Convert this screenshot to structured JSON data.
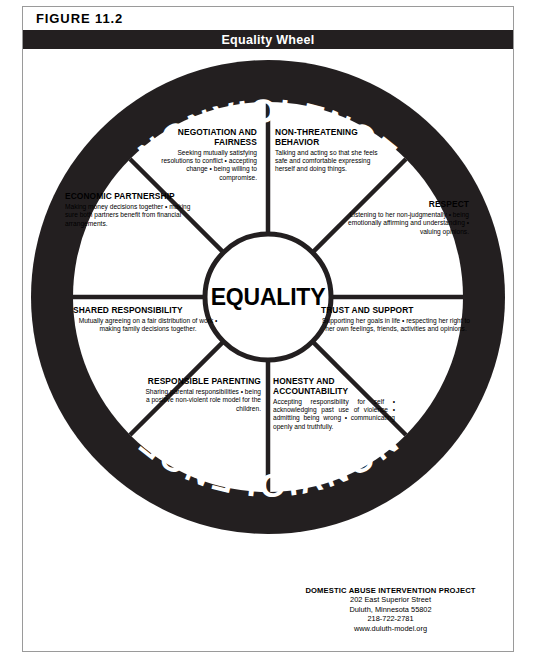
{
  "figure": {
    "label": "FIGURE 11.2",
    "title": "Equality Wheel"
  },
  "wheel": {
    "rim_top_label": "NONVIOLENCE",
    "rim_bottom_label": "NONVIOLENCE",
    "hub_label": "EQUALITY",
    "segments": [
      {
        "id": "negotiation",
        "heading": "NEGOTIATION AND FAIRNESS",
        "body": "Seeking mutually satisfying resolutions to conflict • accepting change • being willing to compromise."
      },
      {
        "id": "non-threatening-behavior",
        "heading": "NON-THREATENING BEHAVIOR",
        "body": "Talking and acting so that she feels safe and comfortable expressing herself and doing things."
      },
      {
        "id": "economic-partnership",
        "heading": "ECONOMIC PARTNERSHIP",
        "body": "Making money decisions together • making sure both partners benefit from financial arrangements."
      },
      {
        "id": "respect",
        "heading": "RESPECT",
        "body": "Listening to her non-judgmentally • being emotionally affirming and understanding • valuing opinions."
      },
      {
        "id": "shared-responsibility",
        "heading": "SHARED RESPONSIBILITY",
        "body": "Mutually agreeing on a fair distribution of work • making family decisions together."
      },
      {
        "id": "trust-and-support",
        "heading": "TRUST AND SUPPORT",
        "body": "Supporting her goals in life • respecting her right to her own feelings, friends, activities and opinions."
      },
      {
        "id": "responsible-parenting",
        "heading": "RESPONSIBLE PARENTING",
        "body": "Sharing parental responsibilities • being a positive non-violent role model for the children."
      },
      {
        "id": "honesty-and-accountability",
        "heading": "HONESTY AND ACCOUNTABILITY",
        "body": "Accepting responsibility for self • acknowledging past use of violence • admitting being wrong • communicating openly and truthfully."
      }
    ]
  },
  "footer": {
    "organization": "DOMESTIC ABUSE INTERVENTION PROJECT",
    "address_line1": "202 East Superior Street",
    "address_line2": "Duluth, Minnesota 55802",
    "phone": "218-722-2781",
    "website": "www.duluth-model.org"
  },
  "colors": {
    "ink": "#231f20",
    "frame": "#9a9a9a",
    "page": "#ffffff"
  }
}
